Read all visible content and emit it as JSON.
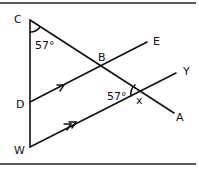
{
  "figure": {
    "type": "geometry",
    "points": {
      "C": {
        "label": "C"
      },
      "B": {
        "label": "B"
      },
      "E": {
        "label": "E"
      },
      "D": {
        "label": "D"
      },
      "Y": {
        "label": "Y"
      },
      "A": {
        "label": "A"
      },
      "W": {
        "label": "W"
      }
    },
    "angles": {
      "at_C": "57°",
      "at_intersection": "57°",
      "unknown": "x"
    },
    "parallel_markers": {
      "DE": "single arrow",
      "WY": "double arrow"
    }
  }
}
